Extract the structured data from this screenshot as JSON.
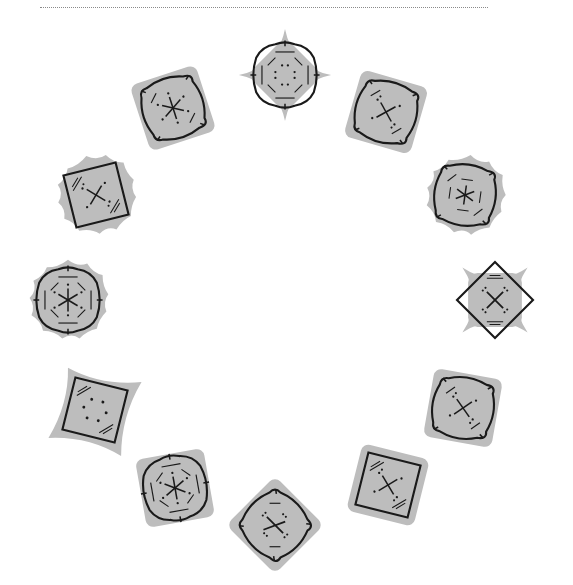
{
  "page": {
    "top_text": "",
    "bg_color": "#ffffff",
    "tile_fill": "#bdbdbd",
    "ink_color": "#1a1a1a"
  },
  "tiles": [
    {
      "id": "tile-1",
      "cx": 285,
      "cy": 75,
      "rot": 0,
      "bg": "star",
      "frame": "bulge-octagon",
      "center": "dots-octagon"
    },
    {
      "id": "tile-2",
      "cx": 173,
      "cy": 108,
      "rot": -18,
      "bg": "rounded-square",
      "frame": "bulge",
      "center": "asterisk"
    },
    {
      "id": "tile-3",
      "cx": 386,
      "cy": 112,
      "rot": 16,
      "bg": "rounded-square",
      "frame": "bulge",
      "center": "x"
    },
    {
      "id": "tile-4",
      "cx": 96,
      "cy": 195,
      "rot": -14,
      "bg": "flower",
      "frame": "square",
      "center": "x"
    },
    {
      "id": "tile-5",
      "cx": 465,
      "cy": 195,
      "rot": 8,
      "bg": "flower",
      "frame": "bulge",
      "center": "asterisk-octagon"
    },
    {
      "id": "tile-6",
      "cx": 68,
      "cy": 300,
      "rot": 0,
      "bg": "flower",
      "frame": "bulge-octagon",
      "center": "asterisk"
    },
    {
      "id": "tile-7",
      "cx": 495,
      "cy": 300,
      "rot": 45,
      "bg": "star",
      "frame": "square",
      "center": "plus"
    },
    {
      "id": "tile-8",
      "cx": 95,
      "cy": 410,
      "rot": 14,
      "bg": "concave",
      "frame": "square",
      "center": "dots"
    },
    {
      "id": "tile-9",
      "cx": 463,
      "cy": 408,
      "rot": 10,
      "bg": "rounded-square",
      "frame": "bulge",
      "center": "x"
    },
    {
      "id": "tile-10",
      "cx": 175,
      "cy": 488,
      "rot": -10,
      "bg": "rounded-square",
      "frame": "bulge-octagon",
      "center": "asterisk"
    },
    {
      "id": "tile-11",
      "cx": 388,
      "cy": 485,
      "rot": 14,
      "bg": "rounded-square",
      "frame": "square",
      "center": "x"
    },
    {
      "id": "tile-12",
      "cx": 275,
      "cy": 525,
      "rot": 45,
      "bg": "rounded-square",
      "frame": "bulge",
      "center": "cross"
    }
  ]
}
